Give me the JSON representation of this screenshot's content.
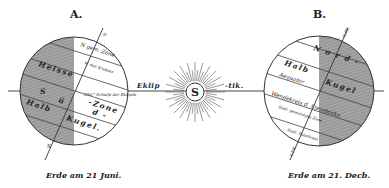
{
  "figure": {
    "ecliptic_left": "Eklip",
    "ecliptic_right": "-tik.",
    "sun": {
      "label": "S"
    },
    "colors": {
      "ink": "#222222",
      "shade": "#9a9a9a",
      "paper": "#ffffff"
    }
  },
  "earth_a": {
    "letter": "A.",
    "caption": "Erde am 21 Juni.",
    "pole_n": "N",
    "pole_s": "S",
    "labels": {
      "north_temperate": "N gem. Zone.",
      "tropic_cancer": "W. des Krebses",
      "obliquity": "23½° Schiefe der Ekliptik",
      "hot": "Heisse",
      "s": "S",
      "u": "ü",
      "zone": "-Zone",
      "d": "d -",
      "halb": "Halb",
      "kugel": "Kugel."
    }
  },
  "earth_b": {
    "letter": "B.",
    "caption": "Erde am 21. Decb.",
    "pole_n": "N",
    "pole_s": "S",
    "labels": {
      "polar_n": "N.P.K.",
      "nord": "N o r d -",
      "halb": "Halb",
      "aequator": "Aequator",
      "kugel": "Kugel",
      "tropic_capricorn": "Wendekreis d. Steinbocks",
      "south_temperate": "Südl. gemässigte Zone",
      "south_polar": "Südl. Polarkreis",
      "s_p_k": "S.P.K."
    }
  }
}
